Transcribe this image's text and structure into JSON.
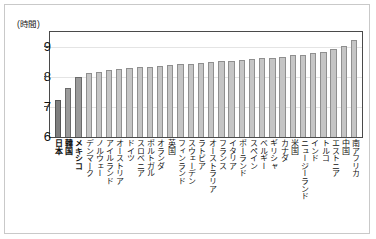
{
  "axis": {
    "unit_label": "(時間)",
    "y_ticks": [
      "9",
      "8",
      "7",
      "6"
    ]
  },
  "chart_data": {
    "type": "bar",
    "title": "",
    "subtitle": "",
    "xlabel": "",
    "ylabel": "(時間)",
    "ylim": [
      6,
      9.5
    ],
    "yticks": [
      6,
      7,
      8,
      9
    ],
    "grid": true,
    "legend": "none",
    "categories": [
      "日本",
      "韓国",
      "メキシコ",
      "デンマーク",
      "ノルウェー",
      "アイルランド",
      "オーストリア",
      "ドイツ",
      "スロベニア",
      "ポルトガル",
      "オランダ",
      "英国",
      "フィンランド",
      "スウェーデン",
      "ラトビア",
      "オーストラリア",
      "フランス",
      "イタリア",
      "ポーランド",
      "スペイン",
      "ベルギー",
      "ギリシャ",
      "カナダ",
      "米国",
      "ニュージーランド",
      "インド",
      "トルコ",
      "エストニア",
      "中国",
      "南アフリカ"
    ],
    "values": [
      7.25,
      7.65,
      8.0,
      8.15,
      8.18,
      8.25,
      8.27,
      8.3,
      8.32,
      8.35,
      8.38,
      8.4,
      8.42,
      8.45,
      8.47,
      8.5,
      8.52,
      8.55,
      8.58,
      8.6,
      8.62,
      8.65,
      8.68,
      8.72,
      8.75,
      8.8,
      8.85,
      8.95,
      9.05,
      9.25
    ],
    "highlight_indices": [
      0,
      1,
      2
    ],
    "bar_color": "#c5c5c5",
    "highlight_color": "#7e7e7e",
    "border_color": "#8f8f8f"
  }
}
